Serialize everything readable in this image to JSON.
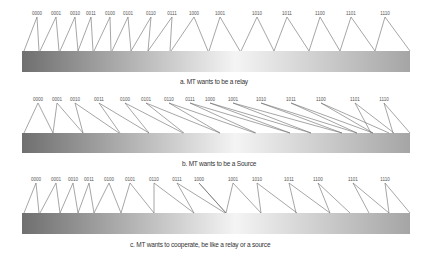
{
  "panels": [
    {
      "id": "a",
      "caption": "a. MT wants to be a relay",
      "labels": [
        "0000",
        "0001",
        "0010",
        "0011",
        "0100",
        "0101",
        "0110",
        "0111",
        "1000",
        "1001",
        "1010",
        "1011",
        "1100",
        "1101",
        "1110"
      ],
      "label_x": [
        37,
        56,
        75,
        91,
        110,
        128,
        151,
        172,
        194,
        220,
        257,
        287,
        320,
        351,
        385
      ],
      "label_y": 15,
      "bar": {
        "x": 22,
        "y": 51,
        "w": 388,
        "h": 21
      },
      "edges": [
        [
          [
            37,
            17
          ],
          [
            24,
            51
          ]
        ],
        [
          [
            37,
            17
          ],
          [
            39,
            51
          ]
        ],
        [
          [
            56,
            17
          ],
          [
            40,
            51
          ]
        ],
        [
          [
            56,
            17
          ],
          [
            59,
            51
          ]
        ],
        [
          [
            75,
            17
          ],
          [
            60,
            51
          ]
        ],
        [
          [
            75,
            17
          ],
          [
            78,
            51
          ]
        ],
        [
          [
            91,
            17
          ],
          [
            78,
            51
          ]
        ],
        [
          [
            91,
            17
          ],
          [
            93,
            51
          ]
        ],
        [
          [
            110,
            17
          ],
          [
            94,
            51
          ]
        ],
        [
          [
            110,
            17
          ],
          [
            111,
            51
          ]
        ],
        [
          [
            128,
            17
          ],
          [
            112,
            51
          ]
        ],
        [
          [
            128,
            17
          ],
          [
            131,
            51
          ]
        ],
        [
          [
            151,
            17
          ],
          [
            131,
            51
          ]
        ],
        [
          [
            151,
            17
          ],
          [
            148,
            51
          ]
        ],
        [
          [
            172,
            17
          ],
          [
            148,
            51
          ]
        ],
        [
          [
            172,
            17
          ],
          [
            170,
            51
          ]
        ],
        [
          [
            194,
            17
          ],
          [
            171,
            51
          ]
        ],
        [
          [
            194,
            17
          ],
          [
            208,
            51
          ]
        ],
        [
          [
            220,
            17
          ],
          [
            209,
            51
          ]
        ],
        [
          [
            220,
            17
          ],
          [
            240,
            51
          ]
        ],
        [
          [
            257,
            17
          ],
          [
            241,
            51
          ]
        ],
        [
          [
            257,
            17
          ],
          [
            274,
            51
          ]
        ],
        [
          [
            287,
            17
          ],
          [
            274,
            51
          ]
        ],
        [
          [
            287,
            17
          ],
          [
            309,
            51
          ]
        ],
        [
          [
            320,
            17
          ],
          [
            309,
            51
          ]
        ],
        [
          [
            320,
            17
          ],
          [
            340,
            51
          ]
        ],
        [
          [
            351,
            17
          ],
          [
            340,
            51
          ]
        ],
        [
          [
            351,
            17
          ],
          [
            375,
            51
          ]
        ],
        [
          [
            385,
            17
          ],
          [
            375,
            51
          ]
        ],
        [
          [
            385,
            17
          ],
          [
            410,
            51
          ]
        ]
      ],
      "caption_x": 180,
      "caption_y": 78
    },
    {
      "id": "b",
      "caption": "b. MT wants to be a Source",
      "labels": [
        "0000",
        "0001",
        "0010",
        "0011",
        "0100",
        "0101",
        "0110",
        "0111",
        "1000",
        "1001",
        "1010",
        "1011",
        "1100",
        "1101",
        "1110"
      ],
      "label_x": [
        38,
        57,
        75,
        99,
        125,
        146,
        169,
        190,
        210,
        233,
        261,
        291,
        321,
        355,
        384
      ],
      "label_y": 101,
      "bar": {
        "x": 22,
        "y": 133,
        "w": 388,
        "h": 20
      },
      "edges": [
        [
          [
            38,
            103
          ],
          [
            24,
            133
          ]
        ],
        [
          [
            38,
            103
          ],
          [
            53,
            133
          ]
        ],
        [
          [
            57,
            103
          ],
          [
            53,
            133
          ]
        ],
        [
          [
            57,
            103
          ],
          [
            83,
            133
          ]
        ],
        [
          [
            75,
            103
          ],
          [
            83,
            133
          ]
        ],
        [
          [
            75,
            103
          ],
          [
            119,
            133
          ]
        ],
        [
          [
            99,
            103
          ],
          [
            120,
            133
          ]
        ],
        [
          [
            99,
            103
          ],
          [
            149,
            133
          ]
        ],
        [
          [
            125,
            103
          ],
          [
            149,
            133
          ]
        ],
        [
          [
            125,
            103
          ],
          [
            183,
            133
          ]
        ],
        [
          [
            146,
            103
          ],
          [
            184,
            133
          ]
        ],
        [
          [
            146,
            103
          ],
          [
            220,
            133
          ]
        ],
        [
          [
            169,
            103
          ],
          [
            220,
            133
          ]
        ],
        [
          [
            169,
            103
          ],
          [
            255,
            133
          ]
        ],
        [
          [
            190,
            103
          ],
          [
            256,
            133
          ]
        ],
        [
          [
            190,
            103
          ],
          [
            290,
            133
          ]
        ],
        [
          [
            210,
            103
          ],
          [
            290,
            133
          ]
        ],
        [
          [
            210,
            103
          ],
          [
            311,
            133
          ]
        ],
        [
          [
            233,
            103
          ],
          [
            311,
            133
          ]
        ],
        [
          [
            233,
            103
          ],
          [
            342,
            133
          ]
        ],
        [
          [
            261,
            103
          ],
          [
            342,
            133
          ]
        ],
        [
          [
            261,
            103
          ],
          [
            357,
            133
          ]
        ],
        [
          [
            291,
            103
          ],
          [
            357,
            133
          ]
        ],
        [
          [
            291,
            103
          ],
          [
            373,
            133
          ]
        ],
        [
          [
            321,
            103
          ],
          [
            373,
            133
          ]
        ],
        [
          [
            321,
            103
          ],
          [
            389,
            133
          ]
        ],
        [
          [
            355,
            103
          ],
          [
            371,
            133
          ]
        ],
        [
          [
            355,
            103
          ],
          [
            394,
            133
          ]
        ],
        [
          [
            384,
            103
          ],
          [
            393,
            133
          ]
        ],
        [
          [
            384,
            103
          ],
          [
            410,
            133
          ]
        ]
      ],
      "caption_x": 182,
      "caption_y": 160
    },
    {
      "id": "c",
      "caption": "c. MT wants to cooperate, be like a relay or a source",
      "labels": [
        "0000",
        "0001",
        "0010",
        "0011",
        "0100",
        "0101",
        "0110",
        "0111",
        "1000",
        "1001",
        "1010",
        "1011",
        "1100",
        "1101",
        "1110"
      ],
      "label_x": [
        36,
        56,
        73,
        89,
        109,
        130,
        154,
        177,
        199,
        233,
        257,
        289,
        318,
        353,
        385
      ],
      "label_y": 181,
      "bar": {
        "x": 22,
        "y": 213,
        "w": 388,
        "h": 21
      },
      "edges": [
        [
          [
            36,
            183
          ],
          [
            24,
            213
          ]
        ],
        [
          [
            36,
            183
          ],
          [
            39,
            213
          ]
        ],
        [
          [
            56,
            183
          ],
          [
            40,
            213
          ]
        ],
        [
          [
            56,
            183
          ],
          [
            60,
            213
          ]
        ],
        [
          [
            73,
            183
          ],
          [
            60,
            213
          ]
        ],
        [
          [
            73,
            183
          ],
          [
            78,
            213
          ]
        ],
        [
          [
            89,
            183
          ],
          [
            78,
            213
          ]
        ],
        [
          [
            89,
            183
          ],
          [
            94,
            213
          ]
        ],
        [
          [
            109,
            183
          ],
          [
            94,
            213
          ]
        ],
        [
          [
            109,
            183
          ],
          [
            121,
            213
          ]
        ],
        [
          [
            130,
            183
          ],
          [
            121,
            213
          ]
        ],
        [
          [
            130,
            183
          ],
          [
            154,
            213
          ]
        ],
        [
          [
            154,
            183
          ],
          [
            154,
            213
          ]
        ],
        [
          [
            154,
            183
          ],
          [
            194,
            213
          ]
        ],
        [
          [
            177,
            183
          ],
          [
            194,
            213
          ]
        ],
        [
          [
            177,
            183
          ],
          [
            225,
            213
          ]
        ],
        [
          [
            199,
            183
          ],
          [
            226,
            213
          ]
        ],
        [
          [
            199,
            183
          ],
          [
            226,
            213
          ]
        ],
        [
          [
            233,
            183
          ],
          [
            226,
            213
          ]
        ],
        [
          [
            233,
            183
          ],
          [
            261,
            213
          ]
        ],
        [
          [
            257,
            183
          ],
          [
            261,
            213
          ]
        ],
        [
          [
            257,
            183
          ],
          [
            297,
            213
          ]
        ],
        [
          [
            289,
            183
          ],
          [
            296,
            213
          ]
        ],
        [
          [
            289,
            183
          ],
          [
            330,
            213
          ]
        ],
        [
          [
            318,
            183
          ],
          [
            330,
            213
          ]
        ],
        [
          [
            318,
            183
          ],
          [
            350,
            213
          ]
        ],
        [
          [
            353,
            183
          ],
          [
            369,
            213
          ]
        ],
        [
          [
            353,
            183
          ],
          [
            389,
            213
          ]
        ],
        [
          [
            385,
            183
          ],
          [
            389,
            213
          ]
        ],
        [
          [
            385,
            183
          ],
          [
            410,
            213
          ]
        ]
      ],
      "caption_x": 130,
      "caption_y": 241
    }
  ],
  "colors": {
    "gradient_left": "#6f6f6f",
    "gradient_mid": "#f4f4f4",
    "gradient_right": "#a5a5a5",
    "line": "#6a6a6a",
    "label": "#555555",
    "caption": "#333333"
  }
}
